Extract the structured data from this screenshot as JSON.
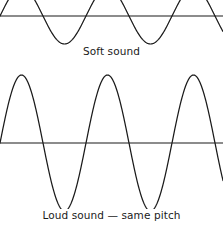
{
  "figure": {
    "width": 223,
    "height": 225,
    "background_color": "#ffffff"
  },
  "style": {
    "wave_stroke_color": "#1a1a1a",
    "axis_line_color": "#8c8c8c",
    "text_color": "#1a1a1a"
  },
  "panels": [
    {
      "id": "soft",
      "caption": "Soft sound",
      "axis_y": 16,
      "amplitude_px": 28,
      "period_px": 86,
      "phase_offset_px": 0,
      "clipped_top": true
    },
    {
      "id": "loud",
      "caption": "Loud sound — same pitch",
      "axis_y": 143,
      "amplitude_px": 68,
      "period_px": 86,
      "phase_offset_px": 0,
      "clipped_top": false
    }
  ],
  "chart_data": {
    "type": "line",
    "xlabel": "",
    "ylabel": "",
    "grid": false,
    "legend_position": "below-each-panel",
    "x_range_px": [
      0,
      223
    ],
    "cycles_visible": 2.5,
    "series": [
      {
        "name": "Soft sound",
        "waveform": "sine",
        "amplitude": 28,
        "wavelength": 86,
        "frequency_relative": 1,
        "baseline_y": 16,
        "annotation": "Soft sound"
      },
      {
        "name": "Loud sound — same pitch",
        "waveform": "sine",
        "amplitude": 68,
        "wavelength": 86,
        "frequency_relative": 1,
        "baseline_y": 143,
        "annotation": "Loud sound — same pitch"
      }
    ]
  }
}
